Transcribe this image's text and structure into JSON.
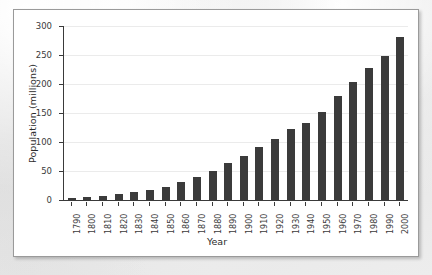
{
  "chart_data": {
    "type": "bar",
    "title": "",
    "xlabel": "Year",
    "ylabel": "Population (millions)",
    "categories": [
      "1790",
      "1800",
      "1810",
      "1820",
      "1830",
      "1840",
      "1850",
      "1860",
      "1870",
      "1880",
      "1890",
      "1900",
      "1910",
      "1920",
      "1930",
      "1940",
      "1950",
      "1960",
      "1970",
      "1980",
      "1990",
      "2000"
    ],
    "values": [
      4,
      5,
      7,
      10,
      13,
      17,
      23,
      31,
      39,
      50,
      63,
      76,
      92,
      106,
      123,
      132,
      151,
      179,
      203,
      227,
      249,
      281
    ],
    "ylim": [
      0,
      300
    ],
    "ytick_labels": [
      "0",
      "50",
      "100",
      "150",
      "200",
      "250",
      "300"
    ],
    "ytick_values": [
      0,
      50,
      100,
      150,
      200,
      250,
      300
    ],
    "grid": true,
    "legend": false,
    "bar_color": "#3b3b3b",
    "axis_color": "#3a3a3a",
    "grid_color": "#ebebeb",
    "plot_background": "#ffffff"
  }
}
